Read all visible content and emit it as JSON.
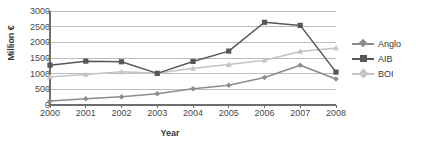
{
  "chart_data": {
    "type": "line",
    "title": "",
    "xlabel": "Year",
    "ylabel": "Million €",
    "categories": [
      "2000",
      "2001",
      "2002",
      "2003",
      "2004",
      "2005",
      "2006",
      "2007",
      "2008"
    ],
    "x": [
      2000,
      2001,
      2002,
      2003,
      2004,
      2005,
      2006,
      2007,
      2008
    ],
    "ylim": [
      0,
      3000
    ],
    "yticks": [
      0,
      500,
      1000,
      1500,
      2000,
      2500,
      3000
    ],
    "ytick_labels": [
      "0",
      "500",
      "1000",
      "1500",
      "2000",
      "2500",
      "3000"
    ],
    "grid": true,
    "grid_axis": "y",
    "legend_position": "right",
    "series": [
      {
        "name": "Anglo",
        "marker": "diamond",
        "color": "#8c8c8c",
        "values": [
          130,
          200,
          260,
          360,
          520,
          630,
          880,
          1270,
          830
        ]
      },
      {
        "name": "AIB",
        "marker": "square",
        "color": "#575757",
        "values": [
          1270,
          1400,
          1380,
          1010,
          1390,
          1720,
          2640,
          2540,
          1050
        ]
      },
      {
        "name": "BOI",
        "marker": "triangle",
        "color": "#c4c4c4",
        "values": [
          900,
          975,
          1060,
          1010,
          1170,
          1290,
          1430,
          1710,
          1820
        ]
      }
    ]
  },
  "legend": {
    "entries": [
      {
        "label": "Anglo"
      },
      {
        "label": "AIB"
      },
      {
        "label": "BOI"
      }
    ]
  },
  "axes": {
    "y_title": "Million €",
    "x_title": "Year"
  },
  "colors": {
    "anglo": "#8c8c8c",
    "aib": "#575757",
    "boi": "#c4c4c4",
    "grid": "#bdbdbd",
    "axis": "#6e6e6e",
    "text": "#3a3a3a"
  }
}
